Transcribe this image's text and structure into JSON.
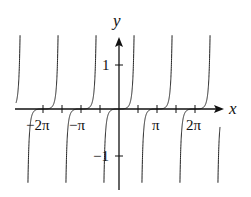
{
  "chart_data": {
    "type": "line",
    "title": "",
    "xlabel": "x",
    "ylabel": "y",
    "x_tick_labels": [
      "−2π",
      "−π",
      "π",
      "2π"
    ],
    "x_tick_values": [
      -6.2832,
      -3.1416,
      3.1416,
      6.2832
    ],
    "x_minor_ticks": "every π/2",
    "y_tick_labels": [
      "1",
      "−1"
    ],
    "y_tick_values": [
      1,
      -1
    ],
    "xlim": [
      -8.3,
      8.7
    ],
    "ylim": [
      -1.7,
      1.7
    ],
    "grid": false,
    "legend": null,
    "series": [
      {
        "name": "periodic curve with flat inflection at zeros and vertical asymptotes",
        "description": "zeros at kπ with horizontal tangent; vertical asymptotes near kπ ± π/2; period π",
        "zeros": [
          -6.2832,
          -3.1416,
          0,
          3.1416,
          6.2832
        ],
        "sample_points": [
          {
            "x": 0,
            "y": 0
          },
          {
            "x": 1.16,
            "y": 1
          },
          {
            "x": -1.16,
            "y": -1
          },
          {
            "x": 1.41,
            "y": 1.7
          },
          {
            "x": -1.41,
            "y": -1.7
          }
        ]
      }
    ]
  },
  "labels": {
    "x_axis": "x",
    "y_axis": "y",
    "neg_two_pi": "−2π",
    "neg_pi": "−π",
    "pi": "π",
    "two_pi": "2π",
    "one": "1",
    "neg_one": "−1"
  },
  "colors": {
    "axis": "#111111",
    "curve": "#222222",
    "background": "#ffffff"
  }
}
